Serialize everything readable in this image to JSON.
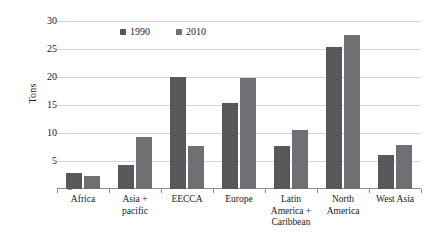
{
  "chart_data": {
    "type": "bar",
    "title": "",
    "xlabel": "",
    "ylabel": "Tons",
    "ylim": [
      0,
      30
    ],
    "yticks": [
      0,
      5,
      10,
      15,
      20,
      25,
      30
    ],
    "ytick_labels": [
      "",
      "5",
      "10",
      "15",
      "20",
      "25",
      "30"
    ],
    "grid": true,
    "legend_position": "top-left-inside",
    "categories": [
      "Africa",
      "Asia + pacific",
      "EECCA",
      "Europe",
      "Latin America + Caribbean",
      "North America",
      "West Asia"
    ],
    "categories_display": [
      [
        "Africa"
      ],
      [
        "Asia +",
        "pacific"
      ],
      [
        "EECCA"
      ],
      [
        "Europe"
      ],
      [
        "Latin",
        "America +",
        "Caribbean"
      ],
      [
        "North",
        "America"
      ],
      [
        "West Asia"
      ]
    ],
    "series": [
      {
        "name": "1990",
        "color": "#58585a",
        "values": [
          2.8,
          4.3,
          20.0,
          15.3,
          7.6,
          25.3,
          6.1
        ]
      },
      {
        "name": "2010",
        "color": "#6e7073",
        "values": [
          2.4,
          9.2,
          7.7,
          19.8,
          10.5,
          27.5,
          7.8
        ]
      }
    ]
  },
  "legend": {
    "entries": [
      {
        "label": "1990",
        "color": "#58585a"
      },
      {
        "label": "2010",
        "color": "#6e7073"
      }
    ]
  },
  "axis": {
    "y_title": "Tons",
    "gridline_color": "#d4d4d4",
    "axis_color": "#8d8d8d"
  }
}
